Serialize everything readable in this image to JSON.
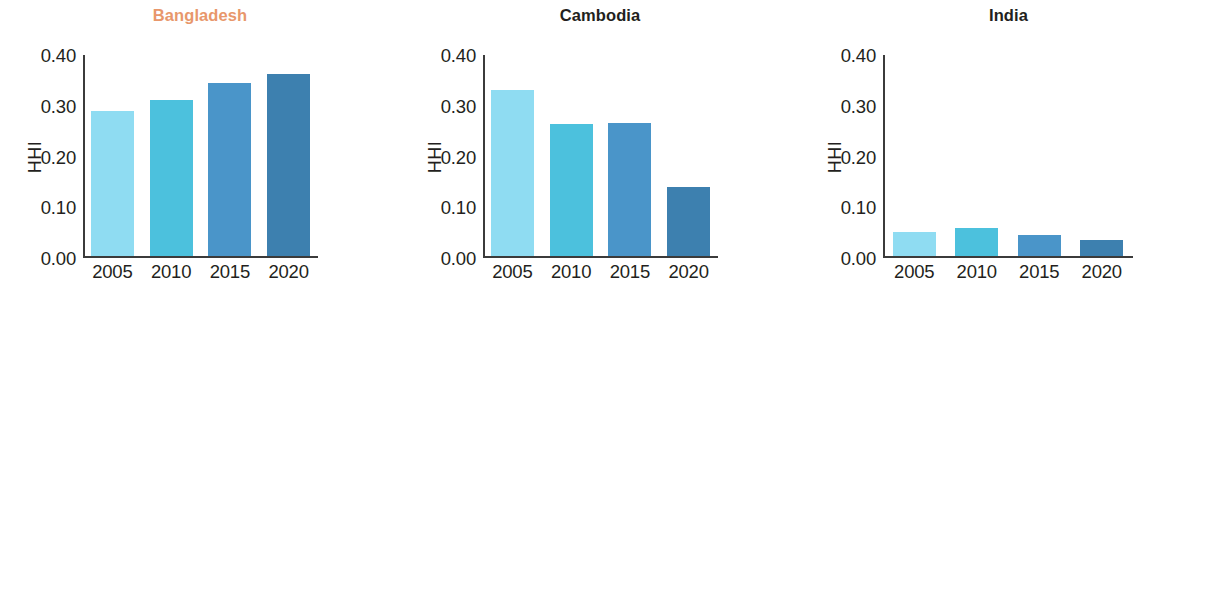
{
  "figure": {
    "panel_order": [
      "bangladesh",
      "cambodia",
      "india",
      "pakistan",
      "prc",
      "vietnam"
    ],
    "highlight_panel": "Bangladesh",
    "highlight_color": "#e8976b",
    "bar_colors": [
      "#8fdcf2",
      "#4cc1dd",
      "#4a95c9",
      "#3d80af"
    ],
    "axis_color": "#3b3b3b",
    "text_color": "#231f20"
  },
  "chart_data": [
    {
      "type": "bar",
      "title": "Bangladesh",
      "xlabel": "",
      "ylabel": "HHI",
      "categories": [
        "2005",
        "2010",
        "2015",
        "2020"
      ],
      "values": [
        0.288,
        0.311,
        0.344,
        0.362
      ],
      "ylim": [
        0.0,
        0.4
      ],
      "yticks": [
        "0.00",
        "0.10",
        "0.20",
        "0.30",
        "0.40"
      ],
      "ytick_values": [
        0.0,
        0.1,
        0.2,
        0.3,
        0.4
      ],
      "grid": false,
      "legend": "none"
    },
    {
      "type": "bar",
      "title": "Cambodia",
      "xlabel": "",
      "ylabel": "HHI",
      "categories": [
        "2005",
        "2010",
        "2015",
        "2020"
      ],
      "values": [
        0.33,
        0.262,
        0.265,
        0.138
      ],
      "ylim": [
        0.0,
        0.4
      ],
      "yticks": [
        "0.00",
        "0.10",
        "0.20",
        "0.30",
        "0.40"
      ],
      "ytick_values": [
        0.0,
        0.1,
        0.2,
        0.3,
        0.4
      ],
      "grid": false,
      "legend": "none"
    },
    {
      "type": "bar",
      "title": "India",
      "xlabel": "",
      "ylabel": "HHI",
      "categories": [
        "2005",
        "2010",
        "2015",
        "2020"
      ],
      "values": [
        0.048,
        0.055,
        0.042,
        0.032
      ],
      "ylim": [
        0.0,
        0.4
      ],
      "yticks": [
        "0.00",
        "0.10",
        "0.20",
        "0.30",
        "0.40"
      ],
      "ytick_values": [
        0.0,
        0.1,
        0.2,
        0.3,
        0.4
      ],
      "grid": false,
      "legend": "none"
    },
    {
      "type": "bar",
      "title": "Pakistan",
      "xlabel": "",
      "ylabel": "HHI",
      "categories": [
        "2005",
        "2010",
        "2015",
        "2020"
      ],
      "values": [
        0.087,
        0.07,
        0.073,
        0.079
      ],
      "ylim": [
        0.0,
        0.4
      ],
      "yticks": [
        "0.00",
        "0.10",
        "0.20",
        "0.30",
        "0.40"
      ],
      "ytick_values": [
        0.0,
        0.1,
        0.2,
        0.3,
        0.4
      ],
      "grid": false,
      "legend": "none"
    },
    {
      "type": "bar",
      "title": "People’s Republic of China",
      "xlabel": "",
      "ylabel": "HHI",
      "categories": [
        "2005",
        "2010",
        "2015",
        "2020"
      ],
      "values": [
        0.099,
        0.108,
        0.115,
        0.128
      ],
      "ylim": [
        0.0,
        0.4
      ],
      "yticks": [
        "0.00",
        "0.10",
        "0.20",
        "0.30",
        "0.40"
      ],
      "ytick_values": [
        0.0,
        0.1,
        0.2,
        0.3,
        0.4
      ],
      "grid": false,
      "legend": "none"
    },
    {
      "type": "bar",
      "title": "Viet Nam",
      "xlabel": "",
      "ylabel": "HHI",
      "categories": [
        "2005",
        "2010",
        "2015",
        "2020"
      ],
      "values": [
        0.079,
        0.046,
        0.121,
        0.186
      ],
      "ylim": [
        0.0,
        0.4
      ],
      "yticks": [
        "0.00",
        "0.10",
        "0.20",
        "0.30",
        "0.40"
      ],
      "ytick_values": [
        0.0,
        0.1,
        0.2,
        0.3,
        0.4
      ],
      "grid": false,
      "legend": "none"
    }
  ]
}
